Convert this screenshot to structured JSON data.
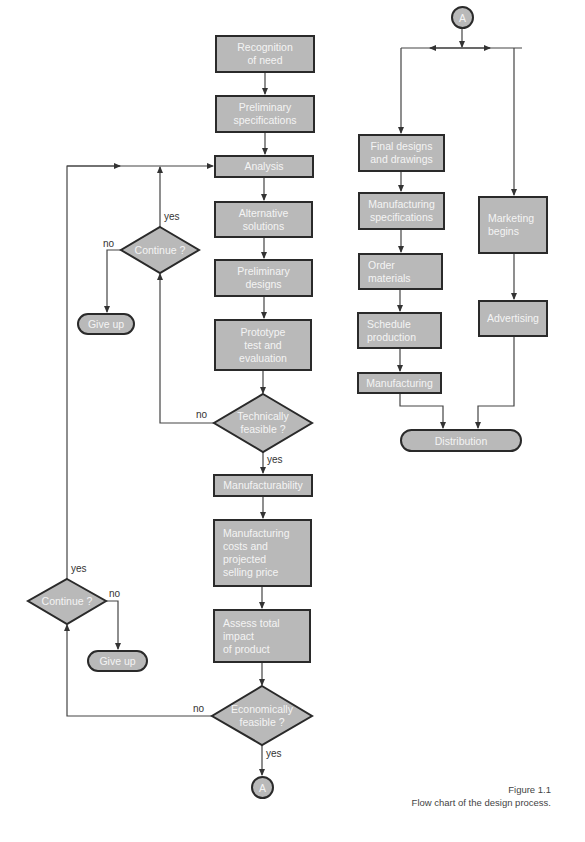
{
  "figure": {
    "number": "Figure 1.1",
    "caption": "Flow chart of the design process."
  },
  "colors": {
    "node_fill": "#b9b9b9",
    "node_border": "#2a2a2a",
    "node_text": "#f4f4f4",
    "line": "#444444"
  },
  "main_flow": {
    "recognition": "Recognition\nof need",
    "prelim_specs": "Preliminary\nspecifications",
    "analysis": "Analysis",
    "alternatives": "Alternative\nsolutions",
    "prelim_designs": "Preliminary\ndesigns",
    "prototype": "Prototype\ntest and\nevaluation",
    "tech_feasible": "Technically\nfeasible ?",
    "manufacturability": "Manufacturability",
    "mfg_costs": "Manufacturing\ncosts and\nprojected\nselling price",
    "assess_impact": "Assess total\nimpact\nof product",
    "econ_feasible": "Economically\nfeasible ?",
    "connector_out": "A"
  },
  "loops": {
    "upper_continue": "Continue ?",
    "upper_give_up": "Give up",
    "lower_continue": "Continue ?",
    "lower_give_up": "Give up"
  },
  "edge_labels": {
    "upper_yes": "yes",
    "upper_no": "no",
    "tech_no": "no",
    "tech_yes": "yes",
    "lower_yes": "yes",
    "lower_no": "no",
    "econ_no": "no",
    "econ_yes": "yes"
  },
  "right_flow": {
    "connector_in": "A",
    "final_designs": "Final designs\nand drawings",
    "mfg_specs": "Manufacturing\nspecifications",
    "order_materials": "Order\nmaterials",
    "schedule": "Schedule\nproduction",
    "manufacturing": "Manufacturing",
    "marketing": "Marketing\nbegins",
    "advertising": "Advertising",
    "distribution": "Distribution"
  }
}
